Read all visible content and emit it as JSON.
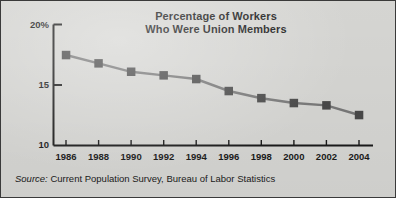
{
  "figure": {
    "background_color": "#d9d9d6",
    "border_color": "#3a3a3a",
    "line_color": "#7a7a7a",
    "marker_color": "#4a4a4a",
    "axis_color": "#1b1b1b"
  },
  "source": {
    "label": "Source:",
    "text": " Current Population Survey, Bureau of Labor Statistics"
  },
  "chart_data": {
    "type": "line",
    "title": "Percentage of Workers Who Were Union Members",
    "title_lines": [
      "Percentage of Workers",
      "Who Were Union Members"
    ],
    "xlabel": "",
    "ylabel": "",
    "x": [
      1986,
      1988,
      1990,
      1992,
      1994,
      1996,
      1998,
      2000,
      2002,
      2004
    ],
    "categories": [
      "1986",
      "1988",
      "1990",
      "1992",
      "1994",
      "1996",
      "1998",
      "2000",
      "2002",
      "2004"
    ],
    "values": [
      17.5,
      16.8,
      16.1,
      15.8,
      15.5,
      14.5,
      13.9,
      13.5,
      13.3,
      12.5
    ],
    "series": [
      {
        "name": "Union membership rate",
        "values": [
          17.5,
          16.8,
          16.1,
          15.8,
          15.5,
          14.5,
          13.9,
          13.5,
          13.3,
          12.5
        ]
      }
    ],
    "ylim": [
      10,
      20
    ],
    "xlim": [
      1985,
      2005
    ],
    "ytick_labels": [
      "20%",
      "15",
      "10"
    ],
    "ytick_values": [
      20,
      15,
      10
    ],
    "xtick_labels": [
      "1986",
      "1988",
      "1990",
      "1992",
      "1994",
      "1996",
      "1998",
      "2000",
      "2002",
      "2004"
    ],
    "grid": false,
    "legend": false,
    "legend_position": "none",
    "marker": "square",
    "annotations": []
  }
}
